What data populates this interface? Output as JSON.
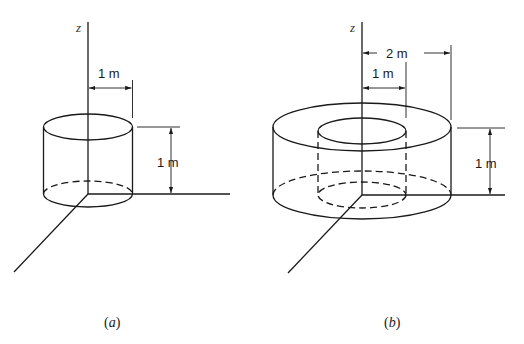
{
  "figure_a": {
    "axis_label": "z",
    "radius_label": "1 m",
    "height_label": "1 m",
    "caption_open": "(",
    "caption_letter": "a",
    "caption_close": ")"
  },
  "figure_b": {
    "axis_label": "z",
    "outer_radius_label": "2 m",
    "inner_radius_label": "1 m",
    "height_label": "1 m",
    "caption_open": "(",
    "caption_letter": "b",
    "caption_close": ")"
  },
  "colors": {
    "line": "#1a1a1a",
    "background": "#ffffff"
  }
}
